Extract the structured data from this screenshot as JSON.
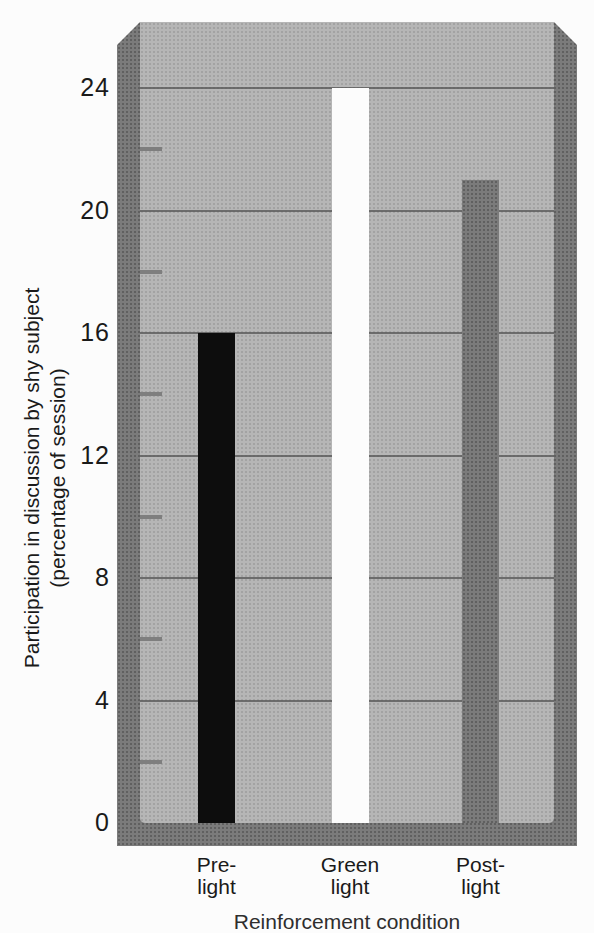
{
  "chart_data": {
    "type": "bar",
    "title": "",
    "categories": [
      "Pre-\nlight",
      "Green\nlight",
      "Post-\nlight"
    ],
    "values": [
      16,
      24,
      21
    ],
    "bar_colors": [
      "#0d0d0d",
      "#fcfcfc",
      "#7b7b7b"
    ],
    "ylabel_lines": [
      "Participation in discussion by shy subject",
      "(percentage of session)"
    ],
    "xlabel": "Reinforcement condition",
    "y_major_ticks": [
      0,
      4,
      8,
      12,
      16,
      20,
      24
    ],
    "y_minor_ticks": [
      2,
      6,
      10,
      14,
      18,
      22
    ],
    "ylim": [
      0,
      26.2
    ],
    "grid": "horizontal major gridlines",
    "legend": "none",
    "colors": {
      "plot_bg": "#b6b6b6",
      "frame": "#7b7b7b",
      "gridline": "#5c5c5c",
      "minor_tick": "#7e7e7e",
      "text": "#1a1a1a",
      "page_bg": "#fcfcfc"
    }
  }
}
